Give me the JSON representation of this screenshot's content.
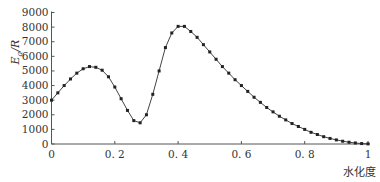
{
  "chart_data": {
    "type": "line",
    "title": "",
    "xlabel": "水化度",
    "ylabel": "Ea/R",
    "ylabel_main": "E",
    "ylabel_sub": "a",
    "ylabel_tail": "/R",
    "xlim": [
      0,
      1
    ],
    "ylim": [
      0,
      9000
    ],
    "grid": false,
    "legend": null,
    "x_ticks": [
      "0",
      "0.2",
      "0.4",
      "0.6",
      "0.8",
      "1"
    ],
    "y_ticks": [
      "0",
      "1000",
      "2000",
      "3000",
      "4000",
      "5000",
      "6000",
      "7000",
      "8000",
      "9000"
    ],
    "marker": "square",
    "series": [
      {
        "name": "Ea/R",
        "x": [
          0,
          0.02,
          0.04,
          0.06,
          0.08,
          0.1,
          0.12,
          0.14,
          0.16,
          0.18,
          0.2,
          0.22,
          0.24,
          0.26,
          0.28,
          0.3,
          0.32,
          0.34,
          0.36,
          0.38,
          0.4,
          0.42,
          0.44,
          0.46,
          0.48,
          0.5,
          0.52,
          0.54,
          0.56,
          0.58,
          0.6,
          0.62,
          0.64,
          0.66,
          0.68,
          0.7,
          0.72,
          0.74,
          0.76,
          0.78,
          0.8,
          0.82,
          0.84,
          0.86,
          0.88,
          0.9,
          0.92,
          0.94,
          0.96,
          0.98,
          1.0
        ],
        "values": [
          3000,
          3500,
          4000,
          4450,
          4850,
          5150,
          5300,
          5250,
          5050,
          4600,
          3900,
          3100,
          2300,
          1600,
          1450,
          2000,
          3400,
          5000,
          6600,
          7600,
          8050,
          8050,
          7700,
          7300,
          6800,
          6300,
          5800,
          5300,
          4850,
          4400,
          4000,
          3600,
          3200,
          2850,
          2500,
          2200,
          1900,
          1650,
          1400,
          1200,
          1000,
          800,
          650,
          500,
          380,
          280,
          190,
          120,
          70,
          30,
          10
        ]
      }
    ]
  },
  "colors": {
    "axis": "#555555",
    "line": "#444444",
    "marker": "#222222",
    "text": "#333333"
  }
}
